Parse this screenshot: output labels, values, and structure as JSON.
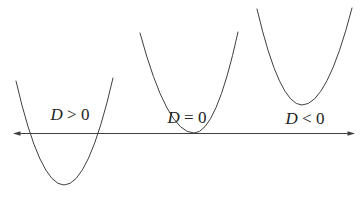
{
  "figure": {
    "background": "#ffffff",
    "stroke_color": "#3f3f3f",
    "text_color": "#222222",
    "axis": {
      "y": 133.5,
      "x_start": 14,
      "x_end": 354
    },
    "cases": [
      {
        "id": "d-positive",
        "label": "D > 0",
        "label_x": 70,
        "label_y": 120,
        "curve": {
          "x1": 16,
          "y1": 81,
          "vx": 64,
          "vy": 185,
          "x2": 113,
          "y2": 78
        }
      },
      {
        "id": "d-zero",
        "label": "D = 0",
        "label_x": 187,
        "label_y": 123,
        "curve": {
          "x1": 140,
          "y1": 33,
          "vx": 194,
          "vy": 133,
          "x2": 238,
          "y2": 32
        }
      },
      {
        "id": "d-negative",
        "label": "D < 0",
        "label_x": 305,
        "label_y": 124,
        "curve": {
          "x1": 257,
          "y1": 9,
          "vx": 302,
          "vy": 105,
          "x2": 352,
          "y2": 8
        }
      }
    ]
  }
}
